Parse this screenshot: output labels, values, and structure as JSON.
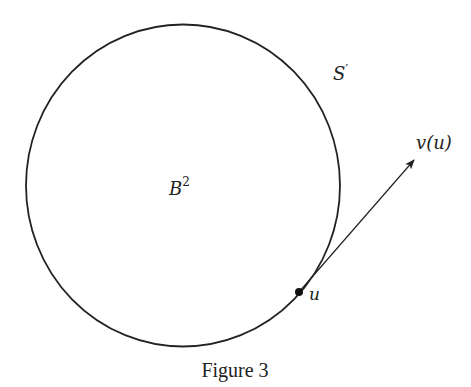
{
  "figure": {
    "caption": "Figure 3",
    "disk_label": "B",
    "disk_label_sup": "2",
    "boundary_label": "S",
    "boundary_label_prime": "′",
    "point_label": "u",
    "vector_label": "v(u)",
    "colors": {
      "stroke": "#222222",
      "background": "#ffffff"
    },
    "geometry": {
      "circle_center": [
        183,
        185
      ],
      "circle_rx": 157,
      "circle_ry": 161,
      "point": [
        299,
        292
      ],
      "arrow_tip": [
        415,
        159
      ]
    }
  }
}
